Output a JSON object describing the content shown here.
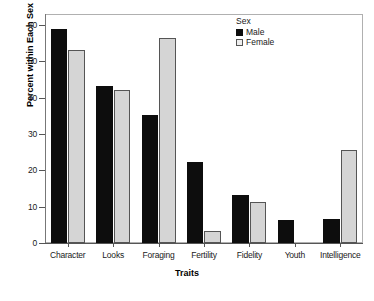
{
  "chart_data": {
    "type": "bar",
    "title": "",
    "xlabel": "Traits",
    "ylabel": "Percent within Each Sex",
    "ylim": [
      0,
      63
    ],
    "yticks": [
      0,
      10,
      20,
      30,
      40,
      50,
      60
    ],
    "ytick_labels": [
      "0",
      "10",
      "20",
      "30",
      "40",
      "50",
      "60"
    ],
    "grid": false,
    "legend": {
      "title": "Sex",
      "position": "top-right",
      "entries": [
        {
          "name": "Male",
          "color": "#0d0d0d"
        },
        {
          "name": "Female",
          "color": "#d5d5d5"
        }
      ]
    },
    "categories": [
      "Character",
      "Looks",
      "Foraging",
      "Fertility",
      "Fidelity",
      "Youth",
      "Intelligence"
    ],
    "series": [
      {
        "name": "Male",
        "color": "#0d0d0d",
        "values": [
          59.0,
          43.2,
          35.2,
          22.3,
          13.3,
          6.3,
          6.5
        ]
      },
      {
        "name": "Female",
        "color": "#d5d5d5",
        "values": [
          53.0,
          42.0,
          56.3,
          3.3,
          11.2,
          0.0,
          25.5
        ]
      }
    ]
  },
  "colors": {
    "male": "#0d0d0d",
    "female": "#d5d5d5",
    "outline": "#555555",
    "frame": "#b0b0b0",
    "background": "#ffffff",
    "text": "#1a1a1a"
  }
}
